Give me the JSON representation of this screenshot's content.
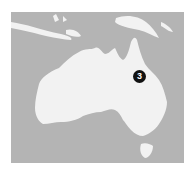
{
  "map": {
    "region": "Australia",
    "colors": {
      "water": "#b4b4b4",
      "land": "#f2f2f2",
      "marker": "#111111",
      "marker_text": "#ffffff",
      "background": "#ffffff"
    },
    "markers": [
      {
        "label": "3",
        "location": "Queensland"
      }
    ]
  }
}
